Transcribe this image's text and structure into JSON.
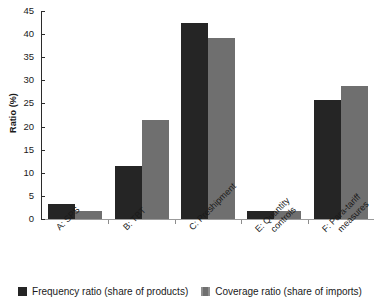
{
  "chart_data": {
    "type": "bar",
    "title": "",
    "subtitle": "",
    "xlabel": "",
    "ylabel": "Ratio (%)",
    "ylim": [
      0,
      45
    ],
    "ytick_step": 5,
    "yticks": [
      "45",
      "40",
      "35",
      "30",
      "25",
      "20",
      "15",
      "10",
      "5",
      "0"
    ],
    "grid": false,
    "legend_position": "bottom-center",
    "categories": [
      "A: SPS",
      "B: TBT",
      "C: Preshipment",
      "E: Quantity controls",
      "F: Para-tariff measures"
    ],
    "category_lines": [
      [
        "A: SPS"
      ],
      [
        "B: TBT"
      ],
      [
        "C: Preshipment"
      ],
      [
        "E: Quantity",
        "controls"
      ],
      [
        "F: Para-tariff",
        "measures"
      ]
    ],
    "series": [
      {
        "name": "Frequency ratio (share of products)",
        "color": "#252525",
        "values": [
          3.3,
          11.5,
          42.5,
          1.7,
          25.7
        ]
      },
      {
        "name": "Coverage ratio (share of imports)",
        "color": "#6f6f6f",
        "values": [
          1.8,
          21.4,
          39.1,
          1.7,
          28.8
        ]
      }
    ]
  },
  "legend": {
    "items": [
      {
        "label": "Frequency ratio (share of products)",
        "swatch": "#252525"
      },
      {
        "label": "Coverage ratio (share of imports)",
        "swatch": "#6f6f6f"
      }
    ]
  }
}
